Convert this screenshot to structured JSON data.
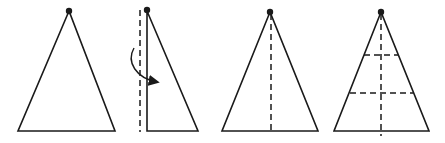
{
  "diagram": {
    "colors": {
      "line": "#1a1a1a",
      "background": "#ffffff"
    },
    "steps": [
      {
        "id": "step-1",
        "shape": "isosceles-triangle",
        "apex": [
          69,
          11
        ],
        "base_left": [
          18,
          131
        ],
        "base_right": [
          115,
          131
        ],
        "fold_lines": []
      },
      {
        "id": "step-2",
        "shape": "right-half-triangle",
        "apex": [
          147,
          11
        ],
        "base_left": [
          147,
          131
        ],
        "base_right": [
          198,
          131
        ],
        "fold_lines": [
          {
            "type": "vertical-dashed",
            "x": 140,
            "y1": 10,
            "y2": 132
          }
        ],
        "arrow": {
          "meaning": "fold left half over to the right",
          "from": [
            134,
            48
          ],
          "to": [
            158,
            83
          ]
        }
      },
      {
        "id": "step-3",
        "shape": "isosceles-triangle",
        "apex": [
          270,
          12
        ],
        "base_left": [
          222,
          131
        ],
        "base_right": [
          318,
          131
        ],
        "fold_lines": [
          {
            "type": "vertical-dashed",
            "x": 271,
            "y1": 14,
            "y2": 132
          }
        ]
      },
      {
        "id": "step-4",
        "shape": "isosceles-triangle",
        "apex": [
          381,
          12
        ],
        "base_left": [
          334,
          131
        ],
        "base_right": [
          429,
          131
        ],
        "fold_lines": [
          {
            "type": "vertical-dashed",
            "x": 381,
            "y1": 14,
            "y2": 136
          },
          {
            "type": "horizontal-dashed",
            "y": 55
          },
          {
            "type": "horizontal-dashed",
            "y": 93
          }
        ]
      }
    ]
  }
}
